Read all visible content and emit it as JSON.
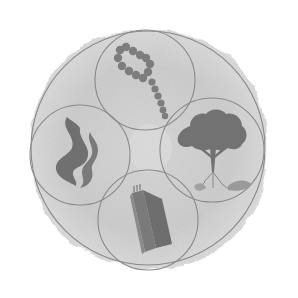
{
  "image": {
    "width": 298,
    "height": 298,
    "background": "#ffffff",
    "description": "Grayscale circular emblem with four overlapping circles inside a larger circle"
  },
  "colors": {
    "blob": "#cfcfcf",
    "blob_edge": "#dcdcdc",
    "circle_stroke": "#8a8a8a",
    "symbol_fill": "#7a7a7a",
    "symbol_dark": "#6a6a6a",
    "center_light": "#d8d8d8"
  },
  "emblem": {
    "outer_circle": {
      "cx": 148,
      "cy": 148,
      "r": 117
    },
    "circles": [
      {
        "id": "top",
        "cx": 145,
        "cy": 80,
        "r": 50,
        "symbol": "rosary-beads-icon",
        "label": "Prayer beads"
      },
      {
        "id": "right",
        "cx": 212,
        "cy": 150,
        "r": 52,
        "symbol": "tree-icon",
        "label": "Tree with roots"
      },
      {
        "id": "left",
        "cx": 80,
        "cy": 155,
        "r": 50,
        "symbol": "flame-icon",
        "label": "Flames"
      },
      {
        "id": "bottom",
        "cx": 148,
        "cy": 220,
        "r": 50,
        "symbol": "book-icon",
        "label": "Book"
      }
    ]
  }
}
